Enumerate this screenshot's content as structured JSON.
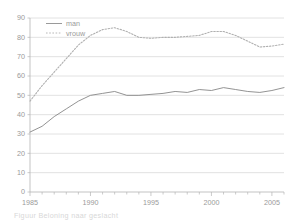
{
  "chart_data": {
    "type": "line",
    "title": "",
    "subtitle": "",
    "xlabel": "",
    "ylabel": "",
    "xlim": [
      1985,
      2006
    ],
    "ylim": [
      0,
      90
    ],
    "yticks": [
      0,
      10,
      20,
      30,
      40,
      50,
      60,
      70,
      80,
      90
    ],
    "ytick_labels": [
      "0",
      "10",
      "20",
      "30",
      "40",
      "50",
      "60",
      "70",
      "80",
      "90"
    ],
    "xticks": [
      1985,
      1990,
      1995,
      2000,
      2005
    ],
    "xtick_labels": [
      "1985",
      "1990",
      "1995",
      "2000",
      "2005"
    ],
    "minor_xticks_every": 1,
    "grid": "horizontal",
    "legend_position": "top-left-inside",
    "x": [
      1985,
      1986,
      1987,
      1988,
      1989,
      1990,
      1991,
      1992,
      1993,
      1994,
      1995,
      1996,
      1997,
      1998,
      1999,
      2000,
      2001,
      2002,
      2003,
      2004,
      2005,
      2006
    ],
    "series": [
      {
        "name": "man",
        "style": "solid",
        "color": "#808080",
        "values": [
          31,
          34,
          39,
          43,
          47,
          50,
          51,
          52,
          50,
          50,
          50.5,
          51,
          52,
          51.5,
          53,
          52.5,
          54,
          53,
          52,
          51.5,
          52.5,
          54
        ]
      },
      {
        "name": "vrouw",
        "style": "dotted",
        "color": "#b0b0b0",
        "values": [
          47,
          55,
          62,
          69,
          76,
          81,
          84,
          85,
          83,
          80,
          79.5,
          80,
          80,
          80.5,
          81,
          83,
          83,
          81,
          78,
          75,
          75.5,
          76.5
        ]
      }
    ]
  },
  "legend": {
    "items": [
      {
        "label": "man"
      },
      {
        "label": "vrouw"
      }
    ]
  },
  "caption": {
    "text": "Figuur    Beloning naar geslacht"
  }
}
